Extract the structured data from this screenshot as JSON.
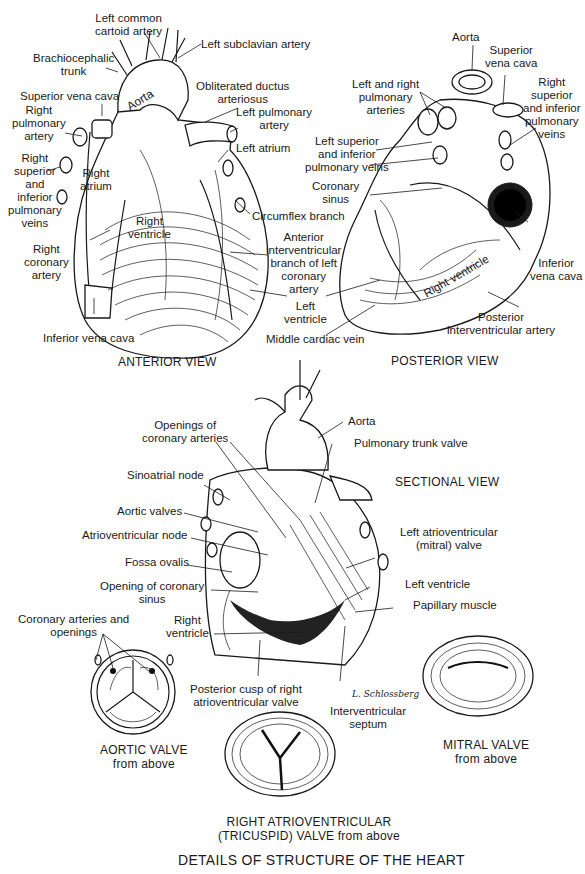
{
  "title": "DETAILS OF STRUCTURE OF THE HEART",
  "anterior_view": {
    "caption": "ANTERIOR VIEW",
    "labels": {
      "left_common_carotid": "Left common\ncartoid artery",
      "left_subclavian": "Left subclavian artery",
      "brachiocephalic": "Brachiocephalic\ntrunk",
      "superior_vena_cava": "Superior vena cava",
      "aorta": "Aorta",
      "obliterated_ductus": "Obliterated ductus\narteriosus",
      "right_pulmonary_artery": "Right\npulmonary\nartery",
      "left_pulmonary_artery": "Left pulmonary\nartery",
      "left_atrium": "Left atrium",
      "right_pulmonary_veins": "Right\nsuperior\nand\ninferior\npulmonary\nveins",
      "right_atrium": "Right\natrium",
      "right_ventricle": "Right\nventricle",
      "circumflex_branch": "Circumflex branch",
      "anterior_interventricular": "Anterior\ninterventricular\nbranch of left\ncoronary\nartery",
      "right_coronary_artery": "Right\ncoronary\nartery",
      "left_ventricle": "Left\nventricle",
      "inferior_vena_cava": "Inferior vena cava",
      "middle_cardiac_vein": "Middle cardiac vein"
    }
  },
  "posterior_view": {
    "caption": "POSTERIOR VIEW",
    "labels": {
      "aorta": "Aorta",
      "superior_vena_cava": "Superior\nvena cava",
      "left_right_pulmonary_arteries": "Left and right\npulmonary\narteries",
      "right_pulmonary_veins": "Right\nsuperior\nand inferior\npulmonary\nveins",
      "left_pulmonary_veins": "Left superior\nand inferior\npulmonary veins",
      "coronary_sinus": "Coronary\nsinus",
      "inferior_vena_cava": "Inferior\nvena cava",
      "right_ventricle": "Right ventricle",
      "posterior_interventricular": "Posterior\ninterventricular artery"
    }
  },
  "sectional_view": {
    "caption": "SECTIONAL VIEW",
    "labels": {
      "openings_coronary_arteries": "Openings of\ncoronary arteries",
      "aorta": "Aorta",
      "pulmonary_trunk_valve": "Pulmonary trunk valve",
      "sinoatrial_node": "Sinoatrial node",
      "aortic_valves": "Aortic valves",
      "atrioventricular_node": "Atrioventricular node",
      "left_av_valve": "Left atrioventricular\n(mitral) valve",
      "fossa_ovalis": "Fossa ovalis",
      "opening_coronary_sinus": "Opening of coronary\nsinus",
      "left_ventricle": "Left ventricle",
      "papillary_muscle": "Papillary muscle",
      "right_ventricle": "Right\nventricle",
      "posterior_cusp": "Posterior cusp of right\natrioventricular valve",
      "interventricular_septum": "Interventricular\nseptum",
      "signature": "L. Schlossberg"
    }
  },
  "aortic_valve": {
    "caption": "AORTIC VALVE\nfrom above",
    "label": "Coronary arteries and\nopenings"
  },
  "tricuspid_valve": {
    "caption": "RIGHT ATRIOVENTRICULAR\n(TRICUSPID) VALVE from above"
  },
  "mitral_valve": {
    "caption": "MITRAL VALVE\nfrom above"
  }
}
